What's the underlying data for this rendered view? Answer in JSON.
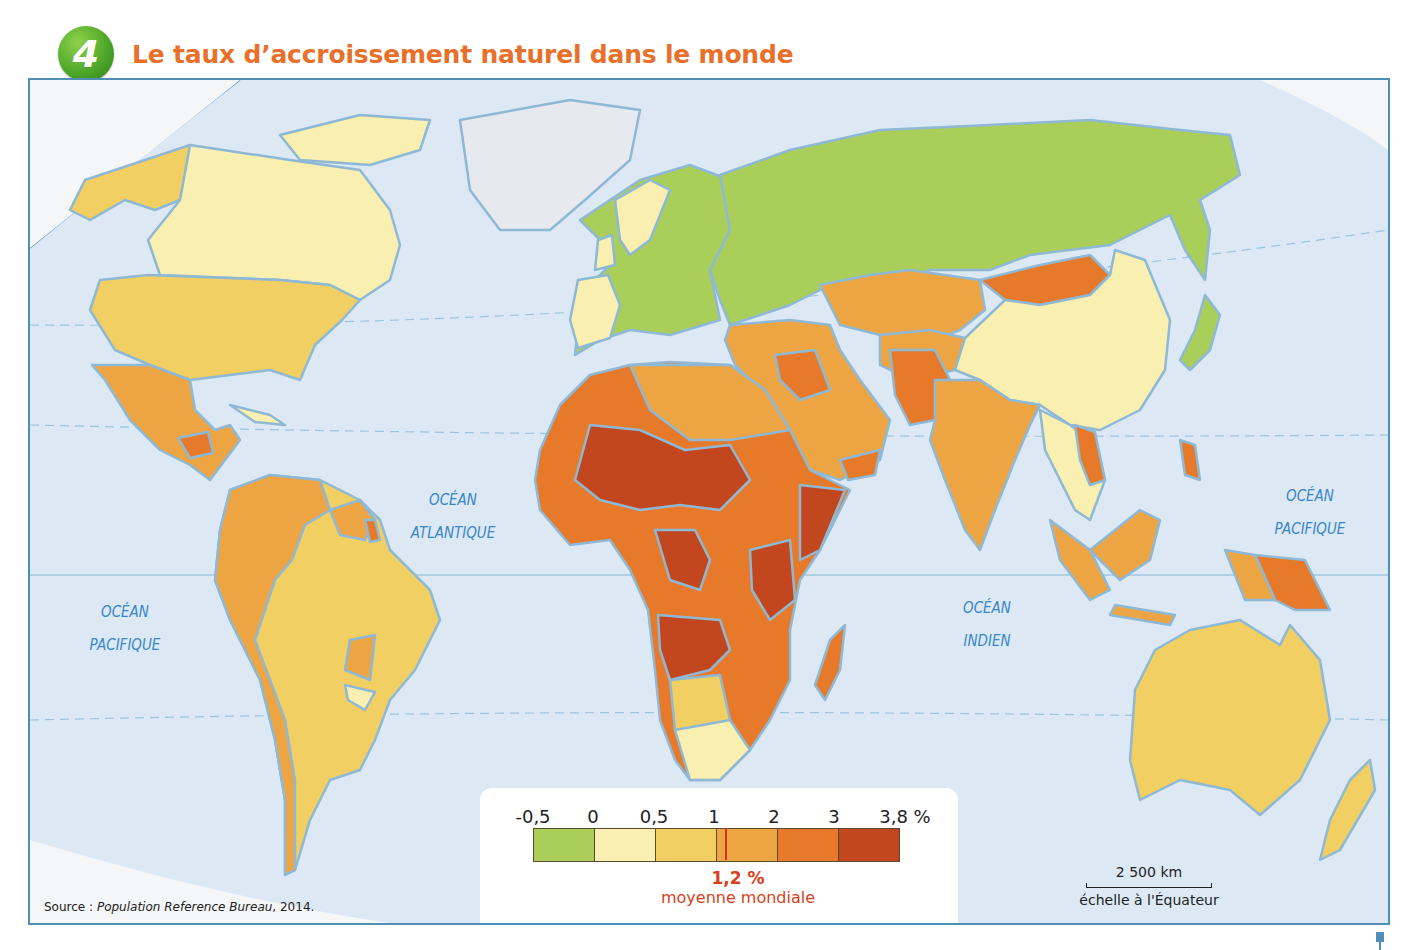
{
  "figure": {
    "number": "4",
    "title": "Le taux d’accroissement naturel dans le monde"
  },
  "oceans": [
    {
      "line1": "OCÉAN",
      "line2": "PACIFIQUE",
      "position": "west"
    },
    {
      "line1": "OCÉAN",
      "line2": "ATLANTIQUE",
      "position": "atlantic"
    },
    {
      "line1": "OCÉAN",
      "line2": "INDIEN",
      "position": "indian"
    },
    {
      "line1": "OCÉAN",
      "line2": "PACIFIQUE",
      "position": "east"
    }
  ],
  "legend": {
    "ticks": [
      "-0,5",
      "0",
      "0,5",
      "1",
      "2",
      "3",
      "3,8 %"
    ],
    "classes": [
      {
        "range": "-0,5 – 0",
        "color": "#a9cf5a"
      },
      {
        "range": "0 – 0,5",
        "color": "#f8efb0"
      },
      {
        "range": "0,5 – 1",
        "color": "#f2cf62"
      },
      {
        "range": "1 – 2",
        "color": "#eda443"
      },
      {
        "range": "2 – 3",
        "color": "#e67a2a"
      },
      {
        "range": "3 – 3,8",
        "color": "#c2461e"
      }
    ],
    "world_average_value": "1,2 %",
    "world_average_label": "moyenne mondiale",
    "world_average_color": "#d8301c"
  },
  "source": {
    "prefix": "Source : ",
    "name": "Population Reference Bureau",
    "suffix": ", 2014."
  },
  "scale": {
    "distance": "2 500 km",
    "caption": "échelle à l'Équateur"
  },
  "colors": {
    "ocean": "#dce9f5",
    "frame": "#4f8fb5",
    "title": "#e8702a",
    "ocean_label": "#3b86c6",
    "no_data": "#e6e9ee"
  },
  "regions": [
    {
      "name": "Russie",
      "class": "-0,5 – 0"
    },
    {
      "name": "Europe",
      "class": "-0,5 – 0 / 0 – 0,5"
    },
    {
      "name": "Canada",
      "class": "0 – 0,5"
    },
    {
      "name": "États-Unis",
      "class": "0,5 – 1"
    },
    {
      "name": "Chine",
      "class": "0 – 0,5"
    },
    {
      "name": "Australie",
      "class": "0,5 – 1"
    },
    {
      "name": "Brésil",
      "class": "0,5 – 1"
    },
    {
      "name": "Mexique",
      "class": "1 – 2"
    },
    {
      "name": "Inde",
      "class": "1 – 2"
    },
    {
      "name": "Mongolie",
      "class": "2 – 3"
    },
    {
      "name": "Afrique subsaharienne",
      "class": "2 – 3 / 3 – 3,8"
    },
    {
      "name": "Groenland",
      "class": "no data"
    }
  ]
}
